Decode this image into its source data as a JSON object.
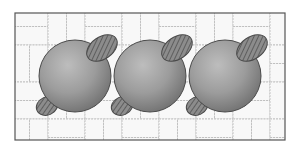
{
  "figure": {
    "frame": {
      "x": 15,
      "y": 13,
      "width": 270,
      "height": 127,
      "stroke": "#555555"
    },
    "colors": {
      "background": "#ffffff",
      "tile_fill": "#f7f7f7",
      "tile_line": "#b5b5b5",
      "sphere_light": "#b8b8b8",
      "sphere_mid": "#9a9a9a",
      "sphere_dark": "#6e6e6e",
      "sphere_outline": "#4a4a4a",
      "lobe_fill": "#8a8a8a",
      "lobe_hatch": "#444444"
    },
    "spheres": [
      {
        "id": "sphere-1",
        "cx": 75,
        "cy": 76,
        "r": 36,
        "upper_lobe": {
          "cx": 102,
          "cy": 48,
          "rx": 17,
          "ry": 11,
          "rotate": -35
        },
        "lower_lobe": {
          "cx": 47,
          "cy": 106,
          "rx": 11,
          "ry": 9,
          "rotate": -25
        }
      },
      {
        "id": "sphere-2",
        "cx": 150,
        "cy": 76,
        "r": 36,
        "upper_lobe": {
          "cx": 177,
          "cy": 48,
          "rx": 17,
          "ry": 11,
          "rotate": -35
        },
        "lower_lobe": {
          "cx": 122,
          "cy": 106,
          "rx": 11,
          "ry": 9,
          "rotate": -25
        }
      },
      {
        "id": "sphere-3",
        "cx": 225,
        "cy": 76,
        "r": 36,
        "upper_lobe": {
          "cx": 252,
          "cy": 48,
          "rx": 17,
          "ry": 11,
          "rotate": -35
        },
        "lower_lobe": {
          "cx": 197,
          "cy": 106,
          "rx": 11,
          "ry": 9,
          "rotate": -25
        }
      }
    ]
  }
}
